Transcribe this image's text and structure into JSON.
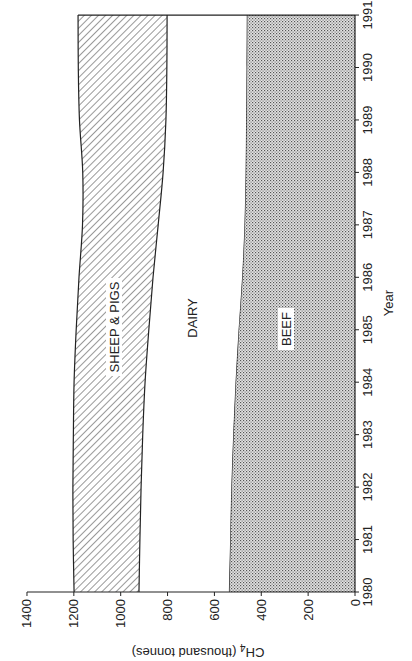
{
  "chart_data": {
    "type": "area",
    "stacked": true,
    "orientation": "rotated 90 degrees clockwise (year axis on right, value axis on bottom)",
    "title": "",
    "xlabel": "Year",
    "ylabel": "CH4 (thousand tonnes)",
    "ylabel_main": "CH",
    "ylabel_sub": "4",
    "ylabel_rest": " (thousand tonnes)",
    "xlim": [
      1980,
      1991
    ],
    "ylim": [
      0,
      1400
    ],
    "x_ticks": [
      "1980",
      "1981",
      "1982",
      "1983",
      "1984",
      "1985",
      "1986",
      "1987",
      "1988",
      "1989",
      "1990",
      "1991"
    ],
    "y_ticks": [
      "0",
      "200",
      "400",
      "600",
      "800",
      "1000",
      "1200",
      "1400"
    ],
    "grid": false,
    "legend": "inline area labels",
    "x": [
      1980,
      1981,
      1982,
      1983,
      1984,
      1985,
      1986,
      1987,
      1988,
      1989,
      1990,
      1991
    ],
    "series": [
      {
        "name": "BEEF",
        "pattern": "dots",
        "cumulative_top": [
          538,
          533,
          528,
          520,
          510,
          497,
          482,
          472,
          467,
          465,
          463,
          462
        ]
      },
      {
        "name": "DAIRY",
        "pattern": "none",
        "cumulative_top": [
          922,
          918,
          913,
          906,
          896,
          880,
          862,
          840,
          819,
          807,
          803,
          802
        ]
      },
      {
        "name": "SHEEP & PIGS",
        "pattern": "diagonal-hatch",
        "cumulative_top": [
          1199,
          1203,
          1204,
          1202,
          1199,
          1190,
          1178,
          1163,
          1162,
          1176,
          1181,
          1182
        ]
      }
    ],
    "values_by_category": {
      "BEEF": [
        538,
        533,
        528,
        520,
        510,
        497,
        482,
        472,
        467,
        465,
        463,
        462
      ],
      "DAIRY": [
        384,
        385,
        385,
        386,
        386,
        383,
        380,
        368,
        352,
        342,
        340,
        340
      ],
      "SHEEP & PIGS": [
        277,
        285,
        291,
        296,
        303,
        310,
        316,
        323,
        343,
        369,
        378,
        380
      ]
    },
    "labels": {
      "beef": "BEEF",
      "dairy": "DAIRY",
      "sheep": "SHEEP & PIGS"
    }
  }
}
